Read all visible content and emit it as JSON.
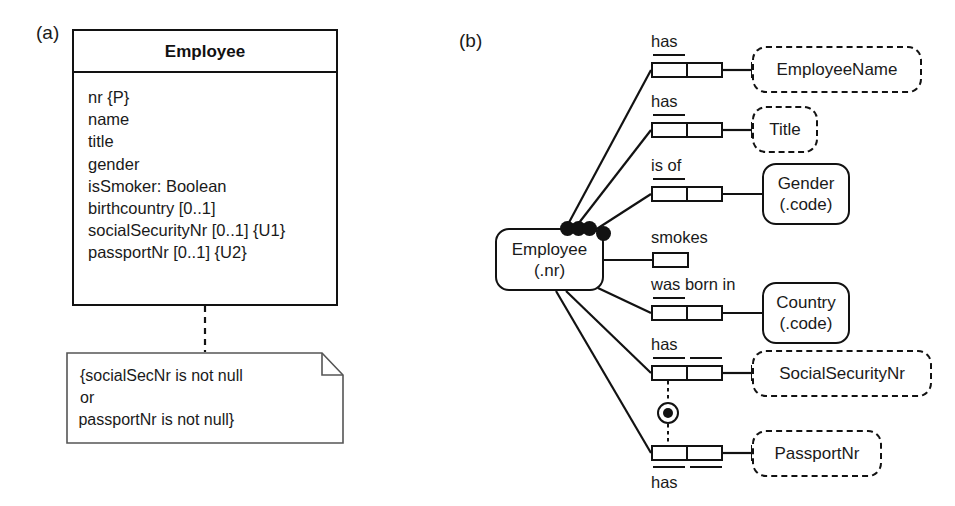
{
  "figure": {
    "panel_a_label": "(a)",
    "panel_b_label": "(b)"
  },
  "uml": {
    "class_name": "Employee",
    "attributes": [
      "nr {P}",
      "name",
      "title",
      "gender",
      "isSmoker: Boolean",
      "birthcountry [0..1]",
      "socialSecurityNr [0..1] {U1}",
      "passportNr [0..1] {U2}"
    ],
    "note": {
      "line1": "{socialSecNr is not null",
      "line2": "or",
      "line3": " passportNr is not null}"
    }
  },
  "orm": {
    "root_entity": {
      "name": "Employee",
      "ref_mode": "(.nr)"
    },
    "facts": [
      {
        "id": "fact-has-employeename",
        "predicate": "has",
        "label_position": "above",
        "roles": 2,
        "uniqueness": "first-role",
        "object": {
          "name": "EmployeeName",
          "ref_mode": "",
          "kind": "value"
        }
      },
      {
        "id": "fact-has-title",
        "predicate": "has",
        "label_position": "above",
        "roles": 2,
        "uniqueness": "first-role",
        "object": {
          "name": "Title",
          "ref_mode": "",
          "kind": "value"
        }
      },
      {
        "id": "fact-is-of-gender",
        "predicate": "is of",
        "label_position": "above",
        "roles": 2,
        "uniqueness": "first-role",
        "object": {
          "name": "Gender",
          "ref_mode": "(.code)",
          "kind": "entity"
        }
      },
      {
        "id": "fact-smokes",
        "predicate": "smokes",
        "label_position": "above",
        "roles": 1,
        "uniqueness": "none",
        "object": null
      },
      {
        "id": "fact-was-born-in-country",
        "predicate": "was born in",
        "label_position": "above",
        "roles": 2,
        "uniqueness": "first-role",
        "object": {
          "name": "Country",
          "ref_mode": "(.code)",
          "kind": "entity"
        }
      },
      {
        "id": "fact-has-socialsecuritynr",
        "predicate": "has",
        "label_position": "above",
        "roles": 2,
        "uniqueness": "both-roles",
        "object": {
          "name": "SocialSecurityNr",
          "ref_mode": "",
          "kind": "value"
        }
      },
      {
        "id": "fact-has-passportnr",
        "predicate": "has",
        "label_position": "below",
        "roles": 2,
        "uniqueness": "both-roles",
        "object": {
          "name": "PassportNr",
          "ref_mode": "",
          "kind": "value"
        }
      }
    ],
    "constraints": {
      "inclusive_or": "inclusive-or-constraint",
      "mandatory_role_dots": 4
    }
  },
  "colors": {
    "stroke": "#121212",
    "text": "#1a1a1a",
    "background": "#ffffff"
  }
}
